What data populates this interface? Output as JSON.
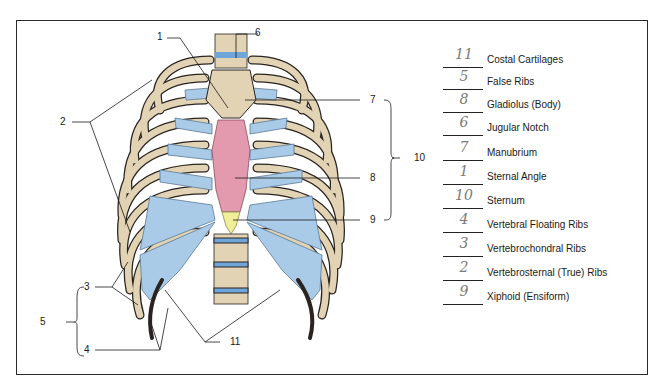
{
  "diagram": {
    "colors": {
      "bone": "#e2d3b4",
      "bone_outline": "#2a2420",
      "cartilage": "#a9cbe8",
      "sternum_body": "#e49aae",
      "xiphoid": "#f1ee9a",
      "frame": "#2b2b2b"
    },
    "callouts": [
      {
        "n": "1",
        "target": "sternal angle"
      },
      {
        "n": "2",
        "target": "true ribs (upper)"
      },
      {
        "n": "3",
        "target": "false ribs (vertebrochondral)"
      },
      {
        "n": "4",
        "target": "floating ribs"
      },
      {
        "n": "5",
        "target": "bracket grouping 3-4"
      },
      {
        "n": "6",
        "target": "jugular notch"
      },
      {
        "n": "7",
        "target": "manubrium"
      },
      {
        "n": "8",
        "target": "gladiolus (body)"
      },
      {
        "n": "9",
        "target": "xiphoid process"
      },
      {
        "n": "10",
        "target": "bracket grouping 7-9 sternum"
      },
      {
        "n": "11",
        "target": "costal cartilages"
      }
    ]
  },
  "answer_key": [
    {
      "answer": "11",
      "term": "Costal Cartilages"
    },
    {
      "answer": "5",
      "term": "False Ribs"
    },
    {
      "answer": "8",
      "term": "Gladiolus (Body)"
    },
    {
      "answer": "6",
      "term": "Jugular Notch"
    },
    {
      "answer": "7",
      "term": "Manubrium"
    },
    {
      "answer": "1",
      "term": "Sternal Angle"
    },
    {
      "answer": "10",
      "term": "Sternum"
    },
    {
      "answer": "4",
      "term": "Vertebral Floating Ribs"
    },
    {
      "answer": "3",
      "term": "Vertebrochondral Ribs"
    },
    {
      "answer": "2",
      "term": "Vertebrosternal (True) Ribs"
    },
    {
      "answer": "9",
      "term": "Xiphoid (Ensiform)"
    }
  ]
}
